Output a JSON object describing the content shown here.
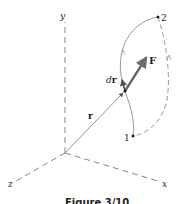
{
  "figure": {
    "axes": {
      "x_label": "x",
      "y_label": "y",
      "z_label": "z"
    },
    "points": {
      "start_label": "1",
      "end_label": "2"
    },
    "vectors": {
      "position_label": "r",
      "displacement_d": "d",
      "displacement_r": "r",
      "force_label": "F"
    },
    "caption": "Figure 3/10"
  },
  "colors": {
    "line": "#555555",
    "path": "#9a9a9a",
    "force": "#6a6a6a",
    "text": "#222222"
  }
}
